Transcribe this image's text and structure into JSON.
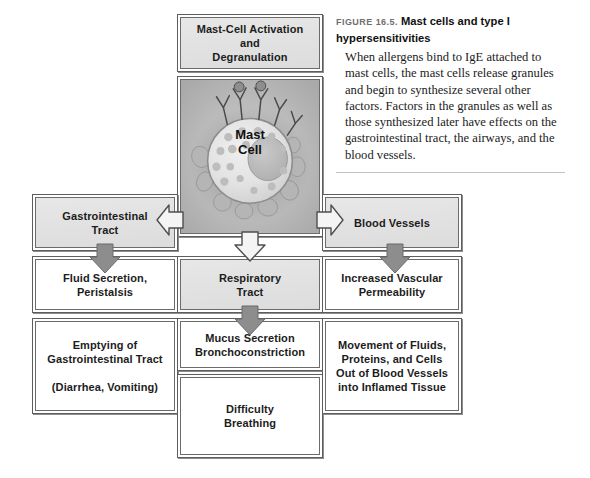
{
  "figure": {
    "number": "FIGURE 16.5.",
    "title": "Mast cells and type I hypersensitivities",
    "body": "When allergens bind to IgE attached to mast cells, the mast cells release granules and begin to synthesize several other factors. Factors in the granules as well as those synthesized later have effects on the gastrointestinal tract, the airways, and the blood vessels."
  },
  "diagram": {
    "top_box": "Mast-Cell Activation\nand\nDegranulation",
    "cell_image_label": "Mast\nCell",
    "branches": {
      "left": {
        "header": "Gastrointestinal\nTract",
        "effect_1": "Fluid Secretion,\nPeristalsis",
        "effect_2": "Emptying of\nGastrointestinal Tract\n\n(Diarrhea, Vomiting)"
      },
      "center": {
        "header": "Respiratory\nTract",
        "effect_1": "Mucus Secretion\nBronchoconstriction",
        "effect_2": "Difficulty\nBreathing"
      },
      "right": {
        "header": "Blood Vessels",
        "effect_1": "Increased Vascular\nPermeability",
        "effect_2": "Movement of Fluids,\nProteins, and Cells\nOut of Blood Vessels\ninto Inflamed Tissue"
      }
    },
    "arrows": {
      "to_left_branch": "arrow-left",
      "to_right_branch": "arrow-right",
      "to_respiratory_tract": "arrow-down-outline",
      "left_effect": "arrow-down",
      "center_effect": "arrow-down",
      "right_effect": "arrow-down"
    }
  },
  "colors": {
    "box_border": "#5d5d5d",
    "box_shade": "#e3e3e3",
    "arrow_fill": "#8a8a8a",
    "arrow_outline_fill": "#f2f2f2",
    "page_background": "#ffffff",
    "cell_panel_background": "#b9b9b9"
  }
}
